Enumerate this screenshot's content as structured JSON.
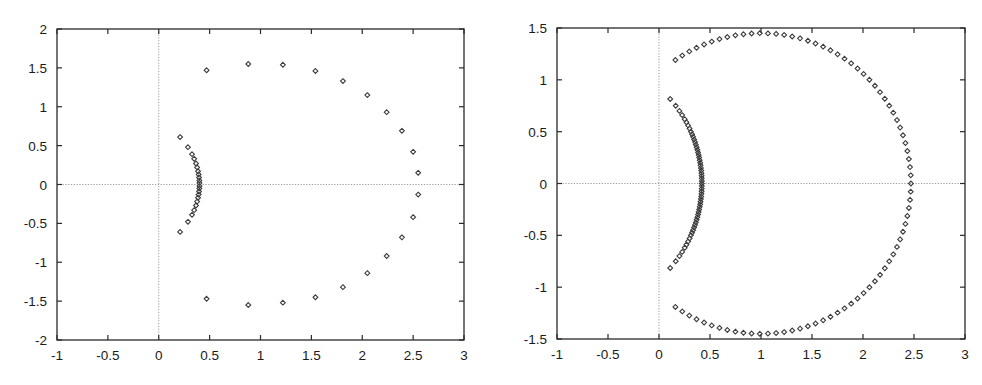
{
  "chart_data": [
    {
      "type": "scatter",
      "title": "",
      "xlabel": "",
      "ylabel": "",
      "xlim": [
        -1,
        3
      ],
      "ylim": [
        -2,
        2
      ],
      "xticks": [
        -1,
        -0.5,
        0,
        0.5,
        1,
        1.5,
        2,
        2.5,
        3
      ],
      "xtick_labels": [
        "-1",
        "-0.5",
        "0",
        "0.5",
        "1",
        "1.5",
        "2",
        "2.5",
        "3"
      ],
      "yticks": [
        2,
        1.5,
        1,
        0.5,
        0,
        -0.5,
        -1,
        -1.5,
        -2
      ],
      "ytick_labels": [
        "2",
        "1.5",
        "1",
        "0.5",
        "0",
        "-0.5",
        "-1",
        "-1.5",
        "-2"
      ],
      "grid": false,
      "zero_axes": true,
      "marker": "diamond",
      "series": [
        {
          "name": "outer",
          "points": [
            [
              0.47,
              1.47
            ],
            [
              0.88,
              1.55
            ],
            [
              1.22,
              1.54
            ],
            [
              1.54,
              1.46
            ],
            [
              1.81,
              1.33
            ],
            [
              2.05,
              1.15
            ],
            [
              2.24,
              0.93
            ],
            [
              2.39,
              0.69
            ],
            [
              2.5,
              0.42
            ],
            [
              2.55,
              0.15
            ],
            [
              2.55,
              -0.13
            ],
            [
              2.5,
              -0.42
            ],
            [
              2.39,
              -0.68
            ],
            [
              2.24,
              -0.92
            ],
            [
              2.05,
              -1.14
            ],
            [
              1.81,
              -1.32
            ],
            [
              1.54,
              -1.45
            ],
            [
              1.22,
              -1.52
            ],
            [
              0.88,
              -1.55
            ],
            [
              0.47,
              -1.47
            ]
          ]
        },
        {
          "name": "inner",
          "points": [
            [
              0.21,
              0.61
            ],
            [
              0.287,
              0.48
            ],
            [
              0.327,
              0.39
            ],
            [
              0.348,
              0.33
            ],
            [
              0.366,
              0.27
            ],
            [
              0.377,
              0.22
            ],
            [
              0.386,
              0.17
            ],
            [
              0.392,
              0.13
            ],
            [
              0.396,
              0.09
            ],
            [
              0.399,
              0.05
            ],
            [
              0.4,
              0.02
            ],
            [
              0.4,
              -0.02
            ],
            [
              0.399,
              -0.05
            ],
            [
              0.396,
              -0.09
            ],
            [
              0.392,
              -0.13
            ],
            [
              0.386,
              -0.17
            ],
            [
              0.377,
              -0.22
            ],
            [
              0.366,
              -0.27
            ],
            [
              0.348,
              -0.33
            ],
            [
              0.327,
              -0.39
            ],
            [
              0.287,
              -0.48
            ],
            [
              0.21,
              -0.61
            ]
          ]
        }
      ]
    },
    {
      "type": "scatter",
      "title": "",
      "xlabel": "",
      "ylabel": "",
      "xlim": [
        -1,
        3
      ],
      "ylim": [
        -1.5,
        1.5
      ],
      "xticks": [
        -1,
        -0.5,
        0,
        0.5,
        1,
        1.5,
        2,
        2.5,
        3
      ],
      "xtick_labels": [
        "-1",
        "-0.5",
        "0",
        "0.5",
        "1",
        "1.5",
        "2",
        "2.5",
        "3"
      ],
      "yticks": [
        1.5,
        1,
        0.5,
        0,
        -0.5,
        -1,
        -1.5
      ],
      "ytick_labels": [
        "1.5",
        "1",
        "0.5",
        "0",
        "-0.5",
        "-1",
        "-1.5"
      ],
      "grid": false,
      "zero_axes": true,
      "marker": "diamond",
      "series": [
        {
          "name": "outer",
          "points": [
            [
              0.161,
              1.191
            ],
            [
              0.228,
              1.234
            ],
            [
              0.297,
              1.274
            ],
            [
              0.368,
              1.309
            ],
            [
              0.442,
              1.341
            ],
            [
              0.517,
              1.369
            ],
            [
              0.593,
              1.393
            ],
            [
              0.67,
              1.413
            ],
            [
              0.749,
              1.429
            ],
            [
              0.828,
              1.44
            ],
            [
              0.908,
              1.447
            ],
            [
              0.988,
              1.45
            ],
            [
              1.068,
              1.448
            ],
            [
              1.148,
              1.443
            ],
            [
              1.227,
              1.433
            ],
            [
              1.306,
              1.418
            ],
            [
              1.383,
              1.4
            ],
            [
              1.46,
              1.377
            ],
            [
              1.535,
              1.35
            ],
            [
              1.609,
              1.32
            ],
            [
              1.681,
              1.285
            ],
            [
              1.751,
              1.246
            ],
            [
              1.819,
              1.204
            ],
            [
              1.884,
              1.159
            ],
            [
              1.947,
              1.109
            ],
            [
              2.006,
              1.057
            ],
            [
              2.063,
              1.001
            ],
            [
              2.117,
              0.943
            ],
            [
              2.167,
              0.881
            ],
            [
              2.214,
              0.818
            ],
            [
              2.257,
              0.751
            ],
            [
              2.297,
              0.683
            ],
            [
              2.333,
              0.612
            ],
            [
              2.364,
              0.539
            ],
            [
              2.392,
              0.465
            ],
            [
              2.416,
              0.39
            ],
            [
              2.435,
              0.313
            ],
            [
              2.45,
              0.236
            ],
            [
              2.461,
              0.158
            ],
            [
              2.468,
              0.079
            ],
            [
              2.47,
              0.0
            ],
            [
              2.468,
              -0.079
            ],
            [
              2.461,
              -0.158
            ],
            [
              2.45,
              -0.236
            ],
            [
              2.435,
              -0.313
            ],
            [
              2.416,
              -0.39
            ],
            [
              2.392,
              -0.465
            ],
            [
              2.364,
              -0.539
            ],
            [
              2.333,
              -0.612
            ],
            [
              2.297,
              -0.683
            ],
            [
              2.257,
              -0.751
            ],
            [
              2.214,
              -0.818
            ],
            [
              2.167,
              -0.881
            ],
            [
              2.117,
              -0.943
            ],
            [
              2.063,
              -1.001
            ],
            [
              2.006,
              -1.057
            ],
            [
              1.947,
              -1.109
            ],
            [
              1.884,
              -1.159
            ],
            [
              1.819,
              -1.204
            ],
            [
              1.751,
              -1.246
            ],
            [
              1.681,
              -1.285
            ],
            [
              1.609,
              -1.32
            ],
            [
              1.535,
              -1.35
            ],
            [
              1.46,
              -1.377
            ],
            [
              1.383,
              -1.4
            ],
            [
              1.306,
              -1.418
            ],
            [
              1.227,
              -1.433
            ],
            [
              1.148,
              -1.443
            ],
            [
              1.068,
              -1.448
            ],
            [
              0.988,
              -1.45
            ],
            [
              0.908,
              -1.447
            ],
            [
              0.828,
              -1.44
            ],
            [
              0.749,
              -1.429
            ],
            [
              0.67,
              -1.413
            ],
            [
              0.593,
              -1.393
            ],
            [
              0.517,
              -1.369
            ],
            [
              0.442,
              -1.341
            ],
            [
              0.368,
              -1.309
            ],
            [
              0.297,
              -1.274
            ],
            [
              0.228,
              -1.234
            ],
            [
              0.161,
              -1.191
            ]
          ]
        },
        {
          "name": "inner",
          "points": [
            [
              0.11,
              0.815
            ],
            [
              0.164,
              0.75
            ],
            [
              0.2,
              0.7
            ],
            [
              0.227,
              0.66
            ],
            [
              0.252,
              0.62
            ],
            [
              0.269,
              0.59
            ],
            [
              0.285,
              0.56
            ],
            [
              0.3,
              0.53
            ],
            [
              0.313,
              0.5
            ],
            [
              0.324,
              0.475
            ],
            [
              0.334,
              0.45
            ],
            [
              0.344,
              0.425
            ],
            [
              0.353,
              0.4
            ],
            [
              0.361,
              0.375
            ],
            [
              0.369,
              0.35
            ],
            [
              0.376,
              0.325
            ],
            [
              0.383,
              0.3
            ],
            [
              0.389,
              0.275
            ],
            [
              0.394,
              0.25
            ],
            [
              0.399,
              0.225
            ],
            [
              0.404,
              0.2
            ],
            [
              0.407,
              0.175
            ],
            [
              0.411,
              0.15
            ],
            [
              0.414,
              0.125
            ],
            [
              0.416,
              0.1
            ],
            [
              0.418,
              0.075
            ],
            [
              0.419,
              0.05
            ],
            [
              0.42,
              0.025
            ],
            [
              0.42,
              0.0
            ],
            [
              0.42,
              -0.025
            ],
            [
              0.419,
              -0.05
            ],
            [
              0.418,
              -0.075
            ],
            [
              0.416,
              -0.1
            ],
            [
              0.414,
              -0.125
            ],
            [
              0.411,
              -0.15
            ],
            [
              0.407,
              -0.175
            ],
            [
              0.404,
              -0.2
            ],
            [
              0.399,
              -0.225
            ],
            [
              0.394,
              -0.25
            ],
            [
              0.389,
              -0.275
            ],
            [
              0.383,
              -0.3
            ],
            [
              0.376,
              -0.325
            ],
            [
              0.369,
              -0.35
            ],
            [
              0.361,
              -0.375
            ],
            [
              0.353,
              -0.4
            ],
            [
              0.344,
              -0.425
            ],
            [
              0.334,
              -0.45
            ],
            [
              0.324,
              -0.475
            ],
            [
              0.313,
              -0.5
            ],
            [
              0.3,
              -0.53
            ],
            [
              0.285,
              -0.56
            ],
            [
              0.269,
              -0.59
            ],
            [
              0.252,
              -0.62
            ],
            [
              0.227,
              -0.66
            ],
            [
              0.2,
              -0.7
            ],
            [
              0.164,
              -0.75
            ],
            [
              0.11,
              -0.815
            ]
          ]
        }
      ]
    }
  ],
  "layout": {
    "plots": [
      {
        "left": 57,
        "top": 29,
        "right": 464,
        "bottom": 340
      },
      {
        "left": 557,
        "top": 28,
        "right": 965,
        "bottom": 339
      }
    ]
  }
}
